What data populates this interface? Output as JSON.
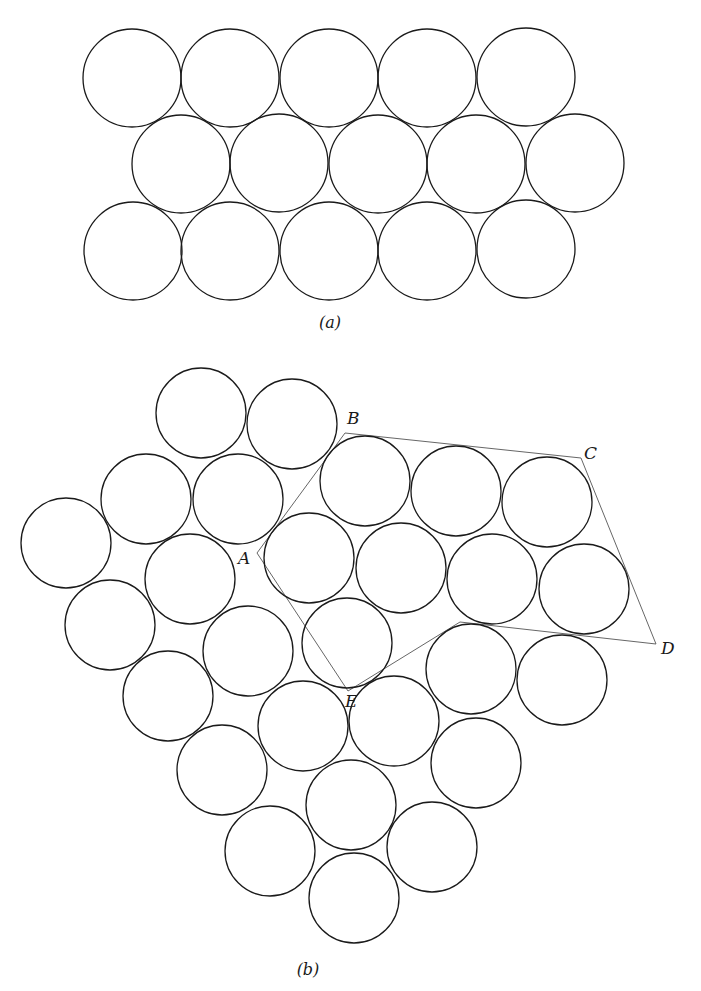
{
  "figure": {
    "style": {
      "stroke_color": "#1a1a1a",
      "cell_line_color": "#555555",
      "background": "#ffffff"
    },
    "panel_a": {
      "caption": "(a)",
      "caption_pos": [
        330,
        328
      ],
      "radius": 49,
      "circles": [
        [
          132,
          78
        ],
        [
          230,
          78
        ],
        [
          329,
          78
        ],
        [
          427,
          78
        ],
        [
          526,
          77
        ],
        [
          181,
          164
        ],
        [
          279,
          163
        ],
        [
          378,
          164
        ],
        [
          476,
          164
        ],
        [
          575,
          163
        ],
        [
          133,
          251
        ],
        [
          230,
          251
        ],
        [
          329,
          251
        ],
        [
          427,
          251
        ],
        [
          526,
          249
        ]
      ]
    },
    "panel_b": {
      "caption": "(b)",
      "caption_pos": [
        308,
        975
      ],
      "radius": 45,
      "circles": [
        [
          201,
          413
        ],
        [
          292,
          424
        ],
        [
          146,
          499
        ],
        [
          238,
          499
        ],
        [
          365,
          481
        ],
        [
          456,
          491
        ],
        [
          547,
          502
        ],
        [
          66,
          543
        ],
        [
          190,
          579
        ],
        [
          309,
          558
        ],
        [
          401,
          568
        ],
        [
          492,
          579
        ],
        [
          584,
          589
        ],
        [
          110,
          625
        ],
        [
          248,
          651
        ],
        [
          347,
          643
        ],
        [
          471,
          669
        ],
        [
          562,
          680
        ],
        [
          168,
          696
        ],
        [
          303,
          726
        ],
        [
          394,
          721
        ],
        [
          476,
          763
        ],
        [
          222,
          770
        ],
        [
          351,
          805
        ],
        [
          270,
          851
        ],
        [
          432,
          847
        ],
        [
          354,
          898
        ]
      ],
      "cell_outline": [
        [
          257,
          553
        ],
        [
          345,
          433
        ],
        [
          581,
          458
        ],
        [
          656,
          644
        ],
        [
          460,
          622
        ],
        [
          348,
          691
        ]
      ],
      "vertex_labels": [
        {
          "text": "A",
          "x": 238,
          "y": 564
        },
        {
          "text": "B",
          "x": 347,
          "y": 424
        },
        {
          "text": "C",
          "x": 584,
          "y": 459
        },
        {
          "text": "D",
          "x": 661,
          "y": 654
        },
        {
          "text": "E",
          "x": 345,
          "y": 707
        }
      ]
    }
  }
}
